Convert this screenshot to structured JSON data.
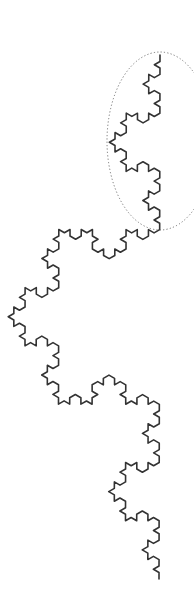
{
  "figure": {
    "width": 194,
    "height": 615,
    "background": "#ffffff",
    "koch_curve": {
      "start": [
        160,
        55
      ],
      "end": [
        159,
        579
      ],
      "iterations": 4,
      "bulge_direction": "left",
      "stroke": "#333333",
      "stroke_width": 1.6
    },
    "highlight_ellipse": {
      "cx": 160,
      "cy": 141,
      "rx": 53,
      "ry": 89,
      "stroke": "#666666",
      "stroke_width": 0.9,
      "dash": "1.2 2.2"
    }
  }
}
